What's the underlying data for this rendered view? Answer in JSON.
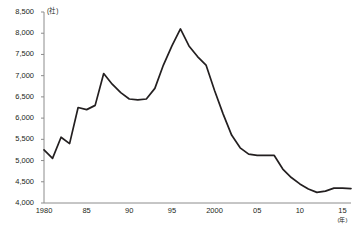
{
  "chart_data": {
    "type": "line",
    "title": "",
    "subtitle": "",
    "xlabel": "",
    "ylabel": "",
    "y_unit": "(社)",
    "x_unit": "(年)",
    "grid": false,
    "legend": null,
    "line_color": "#231f20",
    "axis_color": "#8c8c8c",
    "ylim": [
      4000,
      8500
    ],
    "yticks": [
      8500,
      8000,
      7500,
      7000,
      6500,
      6000,
      5500,
      5000,
      4500,
      4000
    ],
    "ytick_labels": [
      "8,500",
      "8,000",
      "7,500",
      "7,000",
      "6,500",
      "6,000",
      "5,500",
      "5,000",
      "4,500",
      "4,000"
    ],
    "xlim": [
      1980,
      2016
    ],
    "xticks": [
      1980,
      1985,
      1990,
      1995,
      2000,
      2005,
      2010,
      2015
    ],
    "xtick_labels": [
      "1980",
      "85",
      "90",
      "95",
      "2000",
      "05",
      "10",
      "15"
    ],
    "x": [
      1980,
      1981,
      1982,
      1983,
      1984,
      1985,
      1986,
      1987,
      1988,
      1989,
      1990,
      1991,
      1992,
      1993,
      1994,
      1995,
      1996,
      1997,
      1998,
      1999,
      2000,
      2001,
      2002,
      2003,
      2004,
      2005,
      2006,
      2007,
      2008,
      2009,
      2010,
      2011,
      2012,
      2013,
      2014,
      2015,
      2016
    ],
    "values": [
      5250,
      5050,
      5550,
      5400,
      6250,
      6200,
      6300,
      7050,
      6800,
      6600,
      6450,
      6430,
      6450,
      6700,
      7250,
      7700,
      8100,
      7700,
      7450,
      7250,
      6650,
      6100,
      5600,
      5300,
      5150,
      5120,
      5120,
      5120,
      4800,
      4600,
      4450,
      4330,
      4250,
      4280,
      4350,
      4350,
      4340
    ]
  }
}
